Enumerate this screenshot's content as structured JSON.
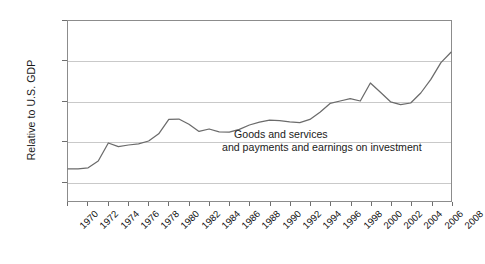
{
  "chart_data": {
    "type": "line",
    "title": "",
    "subtitle": "",
    "xlabel": "",
    "ylabel": "Relative to U.S. GDP",
    "xlim": [
      1970,
      2008
    ],
    "ylim": [
      5,
      50
    ],
    "grid": true,
    "grid_axis": "y",
    "legend": "none",
    "y_ticks": [
      10,
      20,
      30,
      40,
      50
    ],
    "y_tick_labels": [
      "10",
      "20",
      "30",
      "40",
      "50%"
    ],
    "x_tick_labels": [
      "1970",
      "1972",
      "1974",
      "1976",
      "1978",
      "1980",
      "1982",
      "1984",
      "1986",
      "1988",
      "1990",
      "1992",
      "1994",
      "1996",
      "1998",
      "2000",
      "2002",
      "2004",
      "2006",
      "2008"
    ],
    "annotations": [
      {
        "text": "Goods and services"
      },
      {
        "text": "and payments and earnings on investment"
      }
    ],
    "series": [
      {
        "name": "Goods and services and payments and earnings on investment",
        "color": "#6b6b6b",
        "x": [
          1970,
          1971,
          1972,
          1973,
          1974,
          1975,
          1976,
          1977,
          1978,
          1979,
          1980,
          1981,
          1982,
          1983,
          1984,
          1985,
          1986,
          1987,
          1988,
          1989,
          1990,
          1991,
          1992,
          1993,
          1994,
          1995,
          1996,
          1997,
          1998,
          1999,
          2000,
          2001,
          2002,
          2003,
          2004,
          2005,
          2006,
          2007,
          2008
        ],
        "values": [
          13.0,
          13.0,
          13.3,
          15.0,
          19.5,
          18.6,
          19.0,
          19.3,
          20.0,
          21.8,
          25.4,
          25.5,
          24.2,
          22.4,
          23.0,
          22.3,
          22.2,
          22.9,
          24.0,
          24.7,
          25.2,
          25.1,
          24.8,
          24.6,
          25.4,
          27.2,
          29.4,
          30.0,
          30.6,
          30.0,
          34.5,
          32.2,
          29.8,
          29.1,
          29.5,
          32.0,
          35.4,
          39.6,
          42.2
        ]
      }
    ]
  }
}
